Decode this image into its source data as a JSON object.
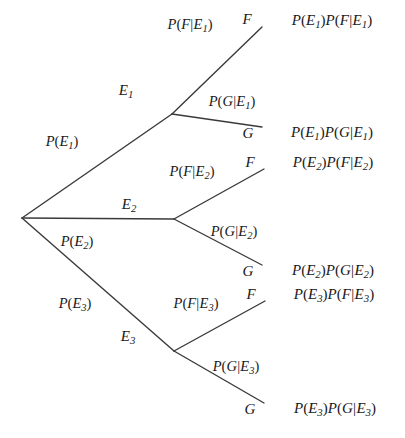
{
  "diagram": {
    "type": "probability-tree",
    "stroke_color": "#3a3a3a",
    "background_color": "#ffffff",
    "text_color": "#1a1a1a",
    "root": {
      "x": 22,
      "y": 218
    },
    "branch_labels_level1": [
      {
        "name": "p-e1",
        "text": "P(E₁)",
        "x": 62,
        "y": 143
      },
      {
        "name": "p-e2",
        "text": "P(E₂)",
        "x": 77,
        "y": 243
      },
      {
        "name": "p-e3",
        "text": "P(E₃)",
        "x": 75,
        "y": 305
      }
    ],
    "level1_nodes": [
      {
        "name": "node-e1",
        "label": "E₁",
        "label_x": 126,
        "label_y": 91,
        "x": 172,
        "y": 114
      },
      {
        "name": "node-e2",
        "label": "E₂",
        "label_x": 129,
        "label_y": 205,
        "x": 174,
        "y": 219
      },
      {
        "name": "node-e3",
        "label": "E₃",
        "label_x": 128,
        "label_y": 337,
        "x": 174,
        "y": 351
      }
    ],
    "branch_labels_level2": [
      {
        "name": "p-f-given-e1",
        "text": "P(F|E₁)",
        "x": 190,
        "y": 26
      },
      {
        "name": "p-g-given-e1",
        "text": "P(G|E₁)",
        "x": 232,
        "y": 103
      },
      {
        "name": "p-f-given-e2",
        "text": "P(F|E₂)",
        "x": 192,
        "y": 173
      },
      {
        "name": "p-g-given-e2",
        "text": "P(G|E₂)",
        "x": 234,
        "y": 233
      },
      {
        "name": "p-f-given-e3",
        "text": "P(F|E₃)",
        "x": 196,
        "y": 305
      },
      {
        "name": "p-g-given-e3",
        "text": "P(G|E₃)",
        "x": 236,
        "y": 368
      }
    ],
    "leaf_nodes": [
      {
        "name": "leaf-f1",
        "label": "F",
        "label_x": 247,
        "label_y": 19,
        "x": 262,
        "y": 23
      },
      {
        "name": "leaf-g1",
        "label": "G",
        "label_x": 248,
        "label_y": 133,
        "x": 262,
        "y": 130
      },
      {
        "name": "leaf-f2",
        "label": "F",
        "label_x": 250,
        "label_y": 162,
        "x": 264,
        "y": 165
      },
      {
        "name": "leaf-g2",
        "label": "G",
        "label_x": 248,
        "label_y": 271,
        "x": 262,
        "y": 268
      },
      {
        "name": "leaf-f3",
        "label": "F",
        "label_x": 251,
        "label_y": 294,
        "x": 265,
        "y": 297
      },
      {
        "name": "leaf-g3",
        "label": "G",
        "label_x": 250,
        "label_y": 409,
        "x": 264,
        "y": 406
      }
    ],
    "outcomes": [
      {
        "name": "outcome-1",
        "text": "P(E₁)P(F|E₁)",
        "x": 332,
        "y": 21
      },
      {
        "name": "outcome-2",
        "text": "P(E₁)P(G|E₁)",
        "x": 332,
        "y": 133
      },
      {
        "name": "outcome-3",
        "text": "P(E₂)P(F|E₂)",
        "x": 333,
        "y": 163
      },
      {
        "name": "outcome-4",
        "text": "P(E₂)P(G|E₂)",
        "x": 333,
        "y": 271
      },
      {
        "name": "outcome-5",
        "text": "P(E₃)P(F|E₃)",
        "x": 334,
        "y": 295
      },
      {
        "name": "outcome-6",
        "text": "P(E₃)P(G|E₃)",
        "x": 335,
        "y": 409
      }
    ],
    "edges": [
      {
        "name": "edge-root-e1",
        "x1": 22,
        "y1": 218,
        "x2": 172,
        "y2": 114
      },
      {
        "name": "edge-root-e2",
        "x1": 22,
        "y1": 218,
        "x2": 174,
        "y2": 219
      },
      {
        "name": "edge-root-e3",
        "x1": 22,
        "y1": 218,
        "x2": 174,
        "y2": 351
      },
      {
        "name": "edge-e1-f",
        "x1": 172,
        "y1": 114,
        "x2": 262,
        "y2": 27
      },
      {
        "name": "edge-e1-g",
        "x1": 172,
        "y1": 114,
        "x2": 262,
        "y2": 127
      },
      {
        "name": "edge-e2-f",
        "x1": 174,
        "y1": 219,
        "x2": 264,
        "y2": 169
      },
      {
        "name": "edge-e2-g",
        "x1": 174,
        "y1": 219,
        "x2": 262,
        "y2": 265
      },
      {
        "name": "edge-e3-f",
        "x1": 174,
        "y1": 351,
        "x2": 265,
        "y2": 301
      },
      {
        "name": "edge-e3-g",
        "x1": 174,
        "y1": 351,
        "x2": 264,
        "y2": 403
      }
    ]
  }
}
